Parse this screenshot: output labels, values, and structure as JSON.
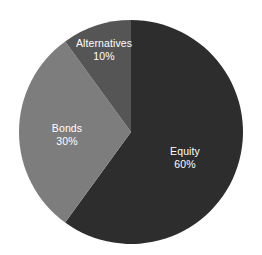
{
  "chart_data": {
    "type": "pie",
    "title": "",
    "subtitle": "",
    "xlabel": "",
    "ylabel": "",
    "legend": "none",
    "grid": false,
    "background_color": "#ffffff",
    "label_color": "#ffffff",
    "start_angle_deg": 0,
    "direction": "clockwise",
    "categories": [
      "Equity",
      "Bonds",
      "Alternatives"
    ],
    "values": [
      60,
      30,
      10
    ],
    "value_unit": "%",
    "colors": [
      "#2d2d2d",
      "#7d7d7d",
      "#555555"
    ],
    "slices": [
      {
        "name": "Equity",
        "value": 60,
        "value_label": "60%",
        "color": "#2d2d2d",
        "label_x": 185,
        "label_y": 158
      },
      {
        "name": "Bonds",
        "value": 30,
        "value_label": "30%",
        "color": "#7d7d7d",
        "label_x": 67,
        "label_y": 135
      },
      {
        "name": "Alternatives",
        "value": 10,
        "value_label": "10%",
        "color": "#555555",
        "label_x": 104,
        "label_y": 50
      }
    ],
    "geometry": {
      "center_x": 131,
      "center_y": 132,
      "radius": 112
    }
  }
}
